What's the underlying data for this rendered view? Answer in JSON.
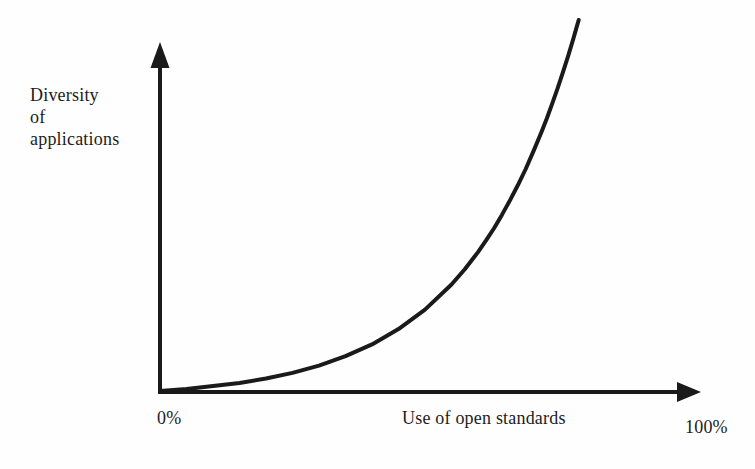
{
  "colors": {
    "line": "#1a1a1a",
    "text": "#1c1c1c",
    "background": "#fefefe"
  },
  "chart_data": {
    "type": "line",
    "title": "",
    "xlabel": "Use of open standards",
    "ylabel": "Diversity of applications",
    "ylabel_display": "Diversity\nof\napplications",
    "x_ticks": [
      "0%",
      "100%"
    ],
    "y_ticks": [],
    "x_range_percent": [
      0,
      100
    ],
    "grid": false,
    "legend": false,
    "axes": {
      "x_arrow": true,
      "y_arrow": true
    },
    "series": [
      {
        "name": "diversity of applications vs use of open standards",
        "points_normalized": [
          [
            0.0,
            0.0
          ],
          [
            0.05,
            0.006
          ],
          [
            0.1,
            0.014
          ],
          [
            0.15,
            0.023
          ],
          [
            0.2,
            0.036
          ],
          [
            0.25,
            0.052
          ],
          [
            0.3,
            0.073
          ],
          [
            0.35,
            0.1
          ],
          [
            0.4,
            0.134
          ],
          [
            0.45,
            0.178
          ],
          [
            0.5,
            0.234
          ],
          [
            0.55,
            0.306
          ],
          [
            0.575,
            0.35
          ],
          [
            0.6,
            0.399
          ],
          [
            0.615,
            0.432
          ],
          [
            0.63,
            0.467
          ],
          [
            0.645,
            0.506
          ],
          [
            0.66,
            0.547
          ],
          [
            0.675,
            0.591
          ],
          [
            0.69,
            0.638
          ],
          [
            0.705,
            0.69
          ],
          [
            0.72,
            0.745
          ],
          [
            0.73,
            0.784
          ],
          [
            0.74,
            0.826
          ],
          [
            0.75,
            0.869
          ],
          [
            0.76,
            0.915
          ],
          [
            0.77,
            0.962
          ],
          [
            0.78,
            1.013
          ],
          [
            0.785,
            1.039
          ],
          [
            0.79,
            1.066
          ]
        ]
      }
    ]
  }
}
